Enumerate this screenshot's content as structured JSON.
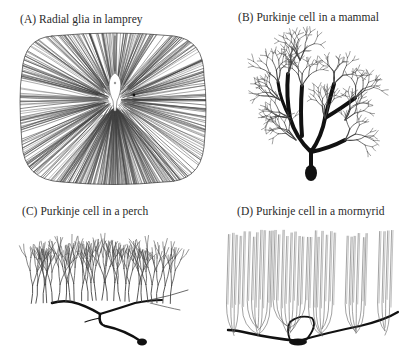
{
  "figure": {
    "panels": [
      {
        "id": "A",
        "label": "(A)  Radial glia in lamprey",
        "x": 20,
        "y": 13
      },
      {
        "id": "B",
        "label": "(B)  Purkinje cell in a mammal",
        "x": 238,
        "y": 11
      },
      {
        "id": "C",
        "label": "(C)  Purkinje cell in a perch",
        "x": 22,
        "y": 205
      },
      {
        "id": "D",
        "label": "(D)  Purkinje cell in a mormyrid",
        "x": 237,
        "y": 205
      }
    ],
    "colors": {
      "ink": "#111111",
      "fine_ink": "#444444",
      "label": "#2a2a2a",
      "background": "#ffffff"
    }
  }
}
